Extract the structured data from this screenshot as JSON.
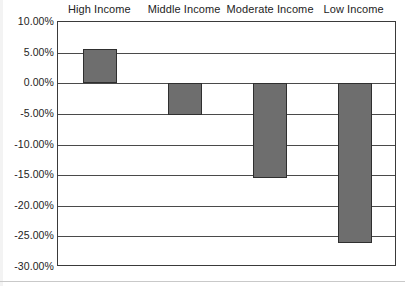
{
  "chart_data": {
    "type": "bar",
    "title": "",
    "subtitle": "",
    "xlabel": "",
    "ylabel": "",
    "categories": [
      "High Income",
      "Middle Income",
      "Moderate Income",
      "Low Income"
    ],
    "values": [
      5.6,
      -5.2,
      -15.5,
      -26.1
    ],
    "value_unit": "percent",
    "ylim": [
      -30.0,
      10.0
    ],
    "ytick_labels": [
      "10.00%",
      "5.00%",
      "0.00%",
      "-5.00%",
      "-10.00%",
      "-15.00%",
      "-20.00%",
      "-25.00%",
      "-30.00%"
    ],
    "ytick_values": [
      10.0,
      5.0,
      0.0,
      -5.0,
      -10.0,
      -15.0,
      -20.0,
      -25.0,
      -30.0
    ],
    "grid": true,
    "grid_axis": "y",
    "legend": false,
    "legend_position": "none",
    "category_label_position": "top",
    "colors": {
      "bar_fill": "#6e6e6e",
      "bar_border": "#2f2f2f",
      "gridline": "#4a4a4a",
      "frame": "#3a3a3a",
      "text": "#232323",
      "background": "#ffffff"
    }
  }
}
